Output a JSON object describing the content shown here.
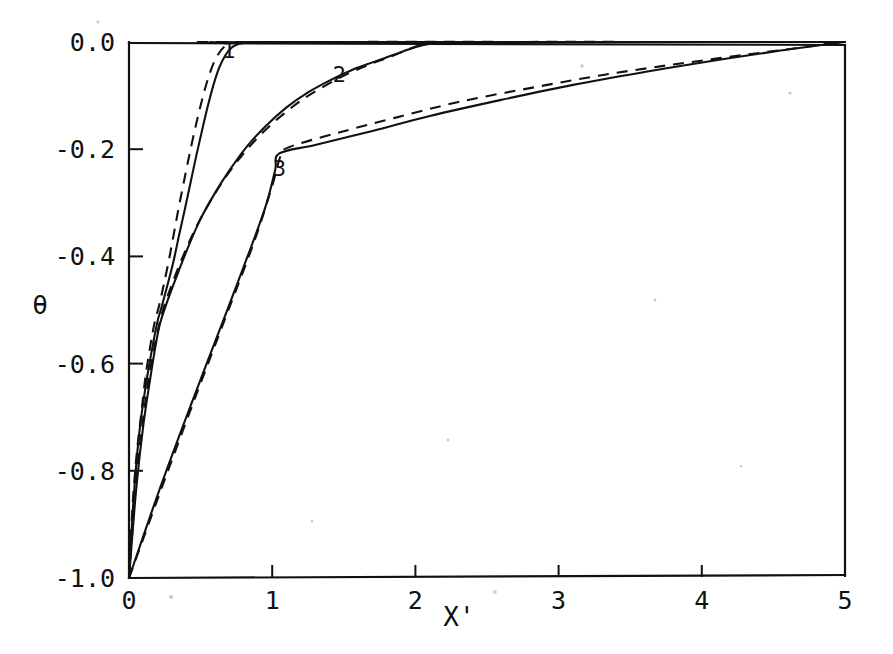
{
  "chart_data": {
    "type": "line",
    "title": "",
    "xlabel": "X'",
    "ylabel": "θ",
    "xlim": [
      0,
      5
    ],
    "ylim": [
      -1.0,
      0.0
    ],
    "xticks": [
      0,
      1,
      2,
      3,
      4,
      5
    ],
    "xticklabels": [
      "0",
      "1",
      "2",
      "3",
      "4",
      "5"
    ],
    "yticks": [
      0.0,
      -0.2,
      -0.4,
      -0.6,
      -0.8,
      -1.0
    ],
    "yticklabels": [
      "0.0",
      "-0.2",
      "-0.4",
      "-0.6",
      "-0.8",
      "-1.0"
    ],
    "grid": false,
    "legend": "none",
    "annotations": [
      {
        "text": "1",
        "x": 0.7,
        "y": -0.03
      },
      {
        "text": "2",
        "x": 1.47,
        "y": -0.075
      },
      {
        "text": "3",
        "x": 1.05,
        "y": -0.25
      }
    ],
    "series": [
      {
        "name": "curve-1-solid",
        "style": "solid",
        "label": "1",
        "points": [
          [
            0.0,
            -1.0
          ],
          [
            0.03,
            -0.86
          ],
          [
            0.06,
            -0.76
          ],
          [
            0.09,
            -0.69
          ],
          [
            0.13,
            -0.62
          ],
          [
            0.17,
            -0.56
          ],
          [
            0.2,
            -0.52
          ],
          [
            0.23,
            -0.492
          ],
          [
            0.27,
            -0.452
          ],
          [
            0.31,
            -0.41
          ],
          [
            0.35,
            -0.36
          ],
          [
            0.39,
            -0.312
          ],
          [
            0.43,
            -0.262
          ],
          [
            0.47,
            -0.212
          ],
          [
            0.51,
            -0.165
          ],
          [
            0.55,
            -0.12
          ],
          [
            0.59,
            -0.08
          ],
          [
            0.63,
            -0.048
          ],
          [
            0.67,
            -0.026
          ],
          [
            0.71,
            -0.012
          ],
          [
            0.75,
            -0.005
          ],
          [
            0.8,
            -0.002
          ],
          [
            0.9,
            0.0
          ],
          [
            5.0,
            0.0
          ]
        ]
      },
      {
        "name": "curve-1-dashed",
        "style": "dashed",
        "label": "1",
        "points": [
          [
            0.0,
            -1.0
          ],
          [
            0.025,
            -0.865
          ],
          [
            0.055,
            -0.765
          ],
          [
            0.085,
            -0.695
          ],
          [
            0.115,
            -0.625
          ],
          [
            0.15,
            -0.565
          ],
          [
            0.18,
            -0.522
          ],
          [
            0.21,
            -0.492
          ],
          [
            0.245,
            -0.45
          ],
          [
            0.28,
            -0.405
          ],
          [
            0.315,
            -0.355
          ],
          [
            0.35,
            -0.305
          ],
          [
            0.39,
            -0.252
          ],
          [
            0.43,
            -0.2
          ],
          [
            0.47,
            -0.152
          ],
          [
            0.51,
            -0.108
          ],
          [
            0.55,
            -0.07
          ],
          [
            0.59,
            -0.04
          ],
          [
            0.63,
            -0.02
          ],
          [
            0.67,
            -0.008
          ],
          [
            0.72,
            -0.002
          ],
          [
            0.8,
            0.0
          ],
          [
            5.0,
            0.0
          ]
        ]
      },
      {
        "name": "curve-2-solid",
        "style": "solid",
        "label": "2",
        "points": [
          [
            0.0,
            -1.0
          ],
          [
            0.05,
            -0.835
          ],
          [
            0.1,
            -0.715
          ],
          [
            0.15,
            -0.625
          ],
          [
            0.19,
            -0.56
          ],
          [
            0.22,
            -0.522
          ],
          [
            0.27,
            -0.482
          ],
          [
            0.34,
            -0.432
          ],
          [
            0.42,
            -0.378
          ],
          [
            0.5,
            -0.33
          ],
          [
            0.6,
            -0.282
          ],
          [
            0.7,
            -0.24
          ],
          [
            0.82,
            -0.196
          ],
          [
            0.95,
            -0.158
          ],
          [
            1.1,
            -0.122
          ],
          [
            1.25,
            -0.094
          ],
          [
            1.4,
            -0.072
          ],
          [
            1.55,
            -0.053
          ],
          [
            1.7,
            -0.038
          ],
          [
            1.85,
            -0.024
          ],
          [
            1.95,
            -0.014
          ],
          [
            2.05,
            -0.006
          ],
          [
            2.15,
            -0.002
          ],
          [
            2.3,
            0.0
          ],
          [
            5.0,
            0.0
          ]
        ]
      },
      {
        "name": "curve-2-dashed",
        "style": "dashed",
        "label": "2",
        "points": [
          [
            0.0,
            -1.0
          ],
          [
            0.05,
            -0.82
          ],
          [
            0.1,
            -0.7
          ],
          [
            0.15,
            -0.608
          ],
          [
            0.2,
            -0.54
          ],
          [
            0.24,
            -0.498
          ],
          [
            0.3,
            -0.452
          ],
          [
            0.38,
            -0.398
          ],
          [
            0.47,
            -0.345
          ],
          [
            0.57,
            -0.296
          ],
          [
            0.68,
            -0.25
          ],
          [
            0.8,
            -0.208
          ],
          [
            0.93,
            -0.17
          ],
          [
            1.08,
            -0.134
          ],
          [
            1.23,
            -0.104
          ],
          [
            1.38,
            -0.08
          ],
          [
            1.53,
            -0.059
          ],
          [
            1.68,
            -0.042
          ],
          [
            1.82,
            -0.028
          ],
          [
            1.93,
            -0.016
          ],
          [
            2.02,
            -0.007
          ],
          [
            2.12,
            -0.002
          ],
          [
            2.25,
            0.0
          ],
          [
            5.0,
            0.0
          ]
        ]
      },
      {
        "name": "curve-3-solid",
        "style": "solid",
        "label": "3",
        "points": [
          [
            0.0,
            -1.0
          ],
          [
            0.2,
            -0.845
          ],
          [
            0.4,
            -0.7
          ],
          [
            0.6,
            -0.56
          ],
          [
            0.8,
            -0.42
          ],
          [
            0.95,
            -0.31
          ],
          [
            1.02,
            -0.24
          ],
          [
            1.05,
            -0.208
          ],
          [
            1.3,
            -0.192
          ],
          [
            1.7,
            -0.166
          ],
          [
            2.1,
            -0.138
          ],
          [
            2.6,
            -0.108
          ],
          [
            3.1,
            -0.08
          ],
          [
            3.6,
            -0.056
          ],
          [
            4.1,
            -0.034
          ],
          [
            4.55,
            -0.016
          ],
          [
            4.85,
            -0.005
          ],
          [
            5.0,
            0.0
          ]
        ]
      },
      {
        "name": "curve-3-dashed",
        "style": "dashed",
        "label": "3",
        "points": [
          [
            0.0,
            -1.0
          ],
          [
            0.22,
            -0.838
          ],
          [
            0.45,
            -0.672
          ],
          [
            0.68,
            -0.51
          ],
          [
            0.88,
            -0.368
          ],
          [
            1.0,
            -0.268
          ],
          [
            1.06,
            -0.212
          ],
          [
            1.12,
            -0.196
          ],
          [
            1.45,
            -0.17
          ],
          [
            1.85,
            -0.142
          ],
          [
            2.3,
            -0.112
          ],
          [
            2.8,
            -0.086
          ],
          [
            3.3,
            -0.062
          ],
          [
            3.8,
            -0.042
          ],
          [
            4.3,
            -0.024
          ],
          [
            4.7,
            -0.01
          ],
          [
            4.92,
            -0.002
          ],
          [
            5.0,
            0.0
          ]
        ]
      }
    ]
  },
  "figure": {
    "background_color": "#ffffff",
    "ink_color": "#111111"
  }
}
